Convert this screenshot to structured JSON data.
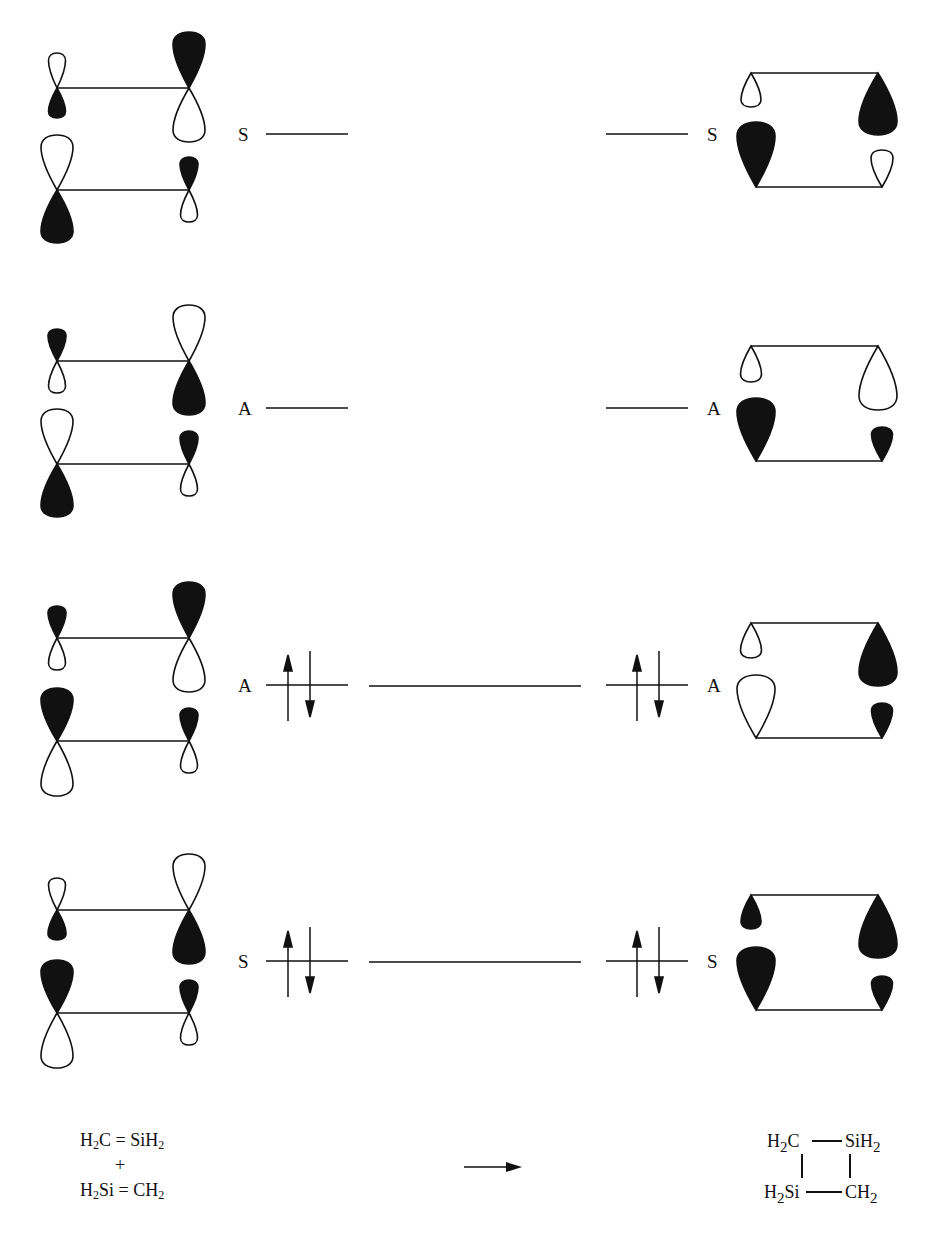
{
  "figure": {
    "colors": {
      "ink": "#111111",
      "background": "#ffffff"
    }
  },
  "levels": [
    {
      "id": "level-1",
      "reactant_symmetry": "S",
      "product_symmetry": "S",
      "occupied": false,
      "y": 134,
      "left_orbitals": {
        "top_pair": [
          "open-small-up/filled-small-down",
          "filled-large-up/open-large-down"
        ],
        "bottom_pair": [
          "open-large-up/filled-large-down",
          "filled-small-up/open-small-down"
        ]
      },
      "right_orbitals": {
        "top": [
          "open-small",
          "filled-large"
        ],
        "bottom": [
          "filled-large",
          "open-small"
        ]
      }
    },
    {
      "id": "level-2",
      "reactant_symmetry": "A",
      "product_symmetry": "A",
      "occupied": false,
      "y": 408
    },
    {
      "id": "level-3",
      "reactant_symmetry": "A",
      "product_symmetry": "A",
      "occupied": true,
      "electrons": "↑↓",
      "y": 685
    },
    {
      "id": "level-4",
      "reactant_symmetry": "S",
      "product_symmetry": "S",
      "occupied": true,
      "electrons": "↑↓",
      "y": 961
    }
  ],
  "reactants": {
    "line1": {
      "a": "H",
      "a_sub": "2",
      "b": "C = SiH",
      "b_sub": "2"
    },
    "plus": "+",
    "line2": {
      "a": "H",
      "a_sub": "2",
      "b": "Si = CH",
      "b_sub": "2"
    }
  },
  "reaction_arrow": "→",
  "product": {
    "top_left": {
      "t": "H",
      "sub": "2",
      "t2": "C"
    },
    "top_right": {
      "t": "SiH",
      "sub": "2"
    },
    "bottom_left": {
      "t": "H",
      "sub": "2",
      "t2": "Si"
    },
    "bottom_right": {
      "t": "CH",
      "sub": "2"
    }
  }
}
